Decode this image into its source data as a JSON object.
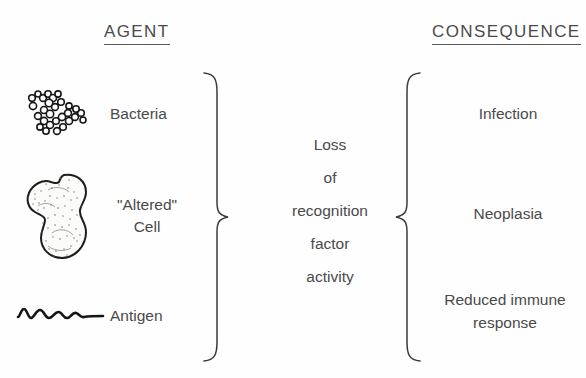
{
  "figure": {
    "background_color": "#fefefe",
    "ink_color": "#3a3a3a"
  },
  "headers": {
    "agent": "AGENT",
    "consequence": "CONSEQUENCE"
  },
  "agents": [
    {
      "icon": "bacteria-cluster-icon",
      "label": "Bacteria"
    },
    {
      "icon": "altered-cell-icon",
      "label_line1": "\"Altered\"",
      "label_line2": "Cell"
    },
    {
      "icon": "antigen-squiggle-icon",
      "label": "Antigen"
    }
  ],
  "center": {
    "lines": [
      "Loss",
      "of",
      "recognition",
      "factor",
      "activity"
    ]
  },
  "consequences": [
    {
      "label": "Infection"
    },
    {
      "label": "Neoplasia"
    },
    {
      "label_line1": "Reduced  immune",
      "label_line2": "response"
    }
  ],
  "braces": {
    "left": "right-facing-curly-brace",
    "right": "left-facing-curly-brace"
  }
}
